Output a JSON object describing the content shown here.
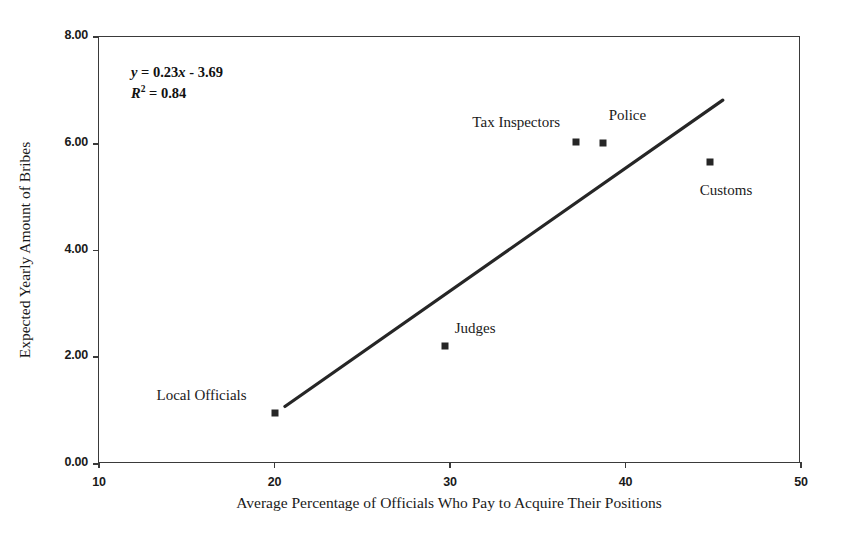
{
  "chart_data": {
    "type": "scatter",
    "title": "",
    "xlabel": "Average Percentage of Officials Who Pay to Acquire Their Positions",
    "ylabel": "Expected Yearly Amount of Bribes",
    "xlim": [
      10,
      50
    ],
    "ylim": [
      0,
      8
    ],
    "xticks": [
      "10",
      "20",
      "30",
      "40",
      "50"
    ],
    "xtick_values": [
      10,
      20,
      30,
      40,
      50
    ],
    "yticks": [
      "0.00",
      "2.00",
      "4.00",
      "6.00",
      "8.00"
    ],
    "ytick_values": [
      0,
      2,
      4,
      6,
      8
    ],
    "grid": false,
    "legend": null,
    "marker_color": "#262626",
    "line_color": "#262626",
    "frame_color": "#3a3a3a",
    "points": [
      {
        "label": "Local Officials",
        "x": 20.0,
        "y": 0.96,
        "label_dx": -118,
        "label_dy": -26
      },
      {
        "label": "Judges",
        "x": 29.7,
        "y": 2.21,
        "label_dx": 10,
        "label_dy": -26
      },
      {
        "label": "Tax Inspectors",
        "x": 37.2,
        "y": 6.03,
        "label_dx": -104,
        "label_dy": -28
      },
      {
        "label": "Police",
        "x": 38.7,
        "y": 6.01,
        "label_dx": 6,
        "label_dy": -36
      },
      {
        "label": "Customs",
        "x": 44.8,
        "y": 5.65,
        "label_dx": -10,
        "label_dy": 20
      }
    ],
    "trendline": {
      "slope": 0.23,
      "intercept": -3.69,
      "x_start": 20.65,
      "x_end": 45.6
    },
    "annotations": {
      "equation_y": "y",
      "equation_body": " = 0.23x - 3.69",
      "r_symbol": "R",
      "r_exponent": "2",
      "r_value": " = 0.84"
    }
  }
}
